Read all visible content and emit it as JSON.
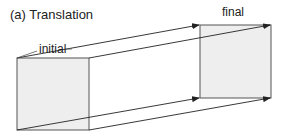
{
  "figure": {
    "title": "(a) Translation",
    "labels": {
      "initial": "initial",
      "final": "final"
    },
    "colors": {
      "square_fill": "#eeeeee",
      "square_stroke": "#555555",
      "arrow": "#222222",
      "text": "#222222"
    },
    "shapes": {
      "initial_square": {
        "x": 17,
        "y": 58,
        "w": 72,
        "h": 72
      },
      "final_square": {
        "x": 200,
        "y": 25,
        "w": 71,
        "h": 73
      }
    },
    "arrows": [
      {
        "from": [
          17,
          58
        ],
        "to": [
          200,
          25
        ]
      },
      {
        "from": [
          89,
          58
        ],
        "to": [
          271,
          25
        ]
      },
      {
        "from": [
          17,
          130
        ],
        "to": [
          200,
          98
        ]
      },
      {
        "from": [
          89,
          130
        ],
        "to": [
          271,
          98
        ]
      }
    ]
  }
}
